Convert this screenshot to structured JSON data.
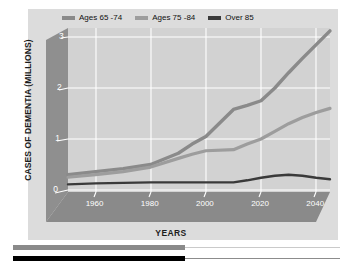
{
  "chart_data": {
    "type": "line",
    "title": "",
    "xlabel": "YEARS",
    "ylabel": "CASES OF DEMENTIA (MILLIONS)",
    "xlim": [
      1950,
      2045
    ],
    "ylim": [
      0,
      3.25
    ],
    "grid": true,
    "legend_position": "top",
    "xticks": [
      "1960",
      "1980",
      "2000",
      "2020",
      "2040"
    ],
    "xtick_values": [
      1960,
      1980,
      2000,
      2020,
      2040
    ],
    "yticks": [
      "0",
      "1",
      "2",
      "3"
    ],
    "ytick_values": [
      0,
      1,
      2,
      3
    ],
    "series": [
      {
        "name": "Ages 65 -74",
        "color": "#8a8a8a",
        "x": [
          1950,
          1960,
          1970,
          1980,
          1990,
          1995,
          2000,
          2010,
          2015,
          2020,
          2025,
          2030,
          2035,
          2040,
          2045
        ],
        "values": [
          0.3,
          0.36,
          0.42,
          0.5,
          0.72,
          0.9,
          1.05,
          1.58,
          1.66,
          1.75,
          2.0,
          2.3,
          2.58,
          2.85,
          3.12
        ]
      },
      {
        "name": "Ages 75 -84",
        "color": "#9d9d9d",
        "x": [
          1950,
          1960,
          1970,
          1980,
          1990,
          1995,
          2000,
          2010,
          2015,
          2020,
          2025,
          2030,
          2035,
          2040,
          2045
        ],
        "values": [
          0.25,
          0.3,
          0.36,
          0.45,
          0.62,
          0.7,
          0.77,
          0.79,
          0.9,
          1.0,
          1.15,
          1.3,
          1.42,
          1.52,
          1.6
        ]
      },
      {
        "name": "Over 85",
        "color": "#3a3a3a",
        "x": [
          1950,
          1960,
          1970,
          1980,
          1990,
          2000,
          2010,
          2015,
          2020,
          2025,
          2030,
          2035,
          2040,
          2045
        ],
        "values": [
          0.11,
          0.13,
          0.14,
          0.15,
          0.15,
          0.15,
          0.15,
          0.19,
          0.24,
          0.28,
          0.3,
          0.28,
          0.24,
          0.21
        ]
      }
    ]
  },
  "legend": {
    "items": [
      {
        "label": "Ages 65 -74",
        "color": "#8a8a8a"
      },
      {
        "label": "Ages 75 -84",
        "color": "#9d9d9d"
      },
      {
        "label": "Over 85",
        "color": "#3a3a3a"
      }
    ]
  },
  "axes": {
    "y_title": "CASES OF DEMENTIA (MILLIONS)",
    "x_title": "YEARS",
    "y_labels": [
      "3",
      "2",
      "1",
      "0"
    ],
    "x_labels": [
      "1960",
      "1980",
      "2000",
      "2020",
      "2040"
    ]
  },
  "colors": {
    "canvas": "#dcdcdc",
    "plot_area": "#d2d2d2",
    "wall": "#8f8f8f",
    "floor": "#8a8a8a",
    "gridline": "#ffffff",
    "page": "#ffffff",
    "rule_gray": "#8a8a8a",
    "rule_black": "#000000"
  },
  "footer": {
    "rules": [
      {
        "name": "gray-rule",
        "color": "#8a8a8a",
        "width": 172
      },
      {
        "name": "black-rule",
        "color": "#000000",
        "width": 172
      }
    ]
  }
}
